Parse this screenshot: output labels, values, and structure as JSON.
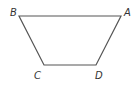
{
  "diagram": {
    "type": "trapezoid",
    "stroke_color": "#555555",
    "vertices": [
      {
        "name": "B",
        "x": 19,
        "y": 16,
        "label_x": 10,
        "label_y": 16
      },
      {
        "name": "A",
        "x": 121,
        "y": 16,
        "label_x": 124,
        "label_y": 16
      },
      {
        "name": "D",
        "x": 96,
        "y": 65,
        "label_x": 95,
        "label_y": 79
      },
      {
        "name": "C",
        "x": 44,
        "y": 65,
        "label_x": 34,
        "label_y": 79
      }
    ],
    "labels": {
      "A": "A",
      "B": "B",
      "C": "C",
      "D": "D"
    }
  }
}
